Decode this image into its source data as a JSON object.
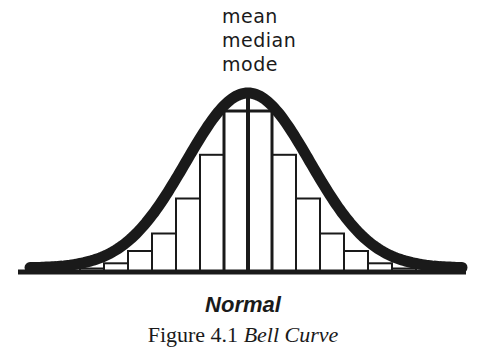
{
  "figure": {
    "annotations": [
      "mean",
      "median",
      "mode"
    ],
    "distribution_label": "Normal",
    "caption_prefix": "Figure 4.1 ",
    "caption_title": "Bell Curve"
  },
  "chart_data": {
    "type": "bar",
    "title": "Normal",
    "caption": "Figure 4.1 Bell Curve",
    "annotations": [
      "mean",
      "median",
      "mode"
    ],
    "bars_relative_height": [
      0.02,
      0.05,
      0.12,
      0.22,
      0.42,
      0.67,
      0.92,
      0.92,
      0.67,
      0.42,
      0.22,
      0.12,
      0.05,
      0.02
    ],
    "xlabel": "",
    "ylabel": "",
    "axes_ticks": "none",
    "grid": false,
    "legend": "none"
  },
  "colors": {
    "ink": "#1a1a1a",
    "background": "#ffffff"
  }
}
